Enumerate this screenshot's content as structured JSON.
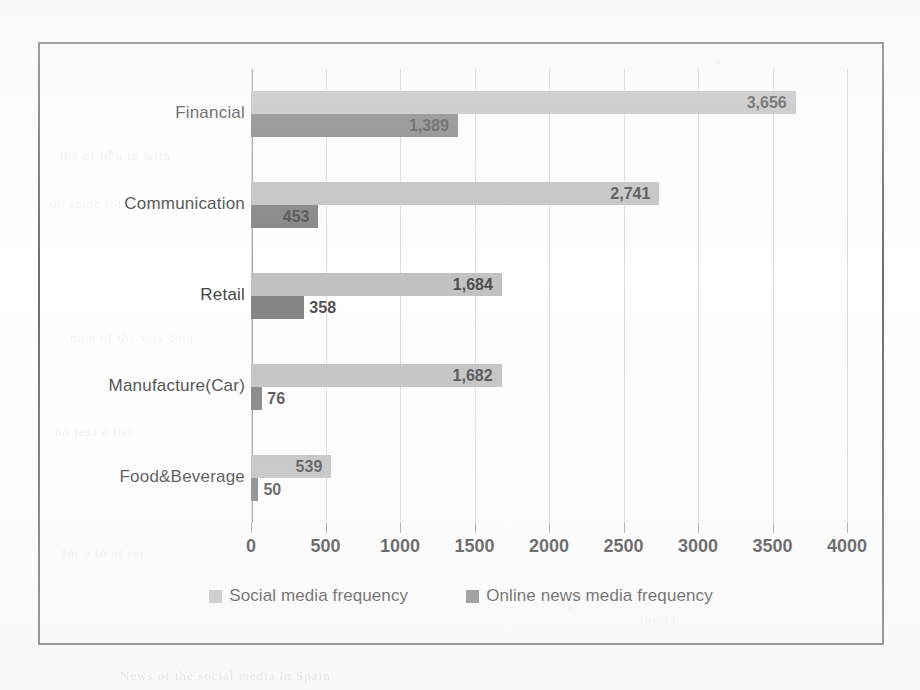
{
  "chart_data": {
    "type": "bar",
    "orientation": "horizontal",
    "title": "",
    "xlabel": "",
    "ylabel": "",
    "categories": [
      "Financial",
      "Communication",
      "Retail",
      "Manufacture(Car)",
      "Food&Beverage"
    ],
    "series": [
      {
        "name": "Social media frequency",
        "color": "#b3b3b3",
        "values": [
          3656,
          2741,
          1684,
          1682,
          539
        ],
        "value_labels": [
          "3,656",
          "2,741",
          "1,684",
          "1,682",
          "539"
        ]
      },
      {
        "name": "Online news media frequency",
        "color": "#636363",
        "values": [
          1389,
          453,
          358,
          76,
          50
        ],
        "value_labels": [
          "1,389",
          "453",
          "358",
          "76",
          "50"
        ]
      }
    ],
    "xlim": [
      0,
      4000
    ],
    "xticks": [
      0,
      500,
      1000,
      1500,
      2000,
      2500,
      3000,
      3500,
      4000
    ],
    "xtick_labels": [
      "0",
      "500",
      "1000",
      "1500",
      "2000",
      "2500",
      "3000",
      "3500",
      "4000"
    ],
    "grid": true,
    "legend_position": "bottom"
  },
  "legend": {
    "items": [
      {
        "label": "Social media frequency",
        "swatch": "social-legend-swatch"
      },
      {
        "label": "Online news media frequency",
        "swatch": "news-legend-swatch"
      }
    ]
  },
  "scan_artifacts": {
    "bleed_lines": [
      "the of in a to with",
      "on some for it and",
      "num of the was data",
      "no text a list",
      "for a to at set",
      "the 11",
      "News of the social media in Spain"
    ]
  }
}
